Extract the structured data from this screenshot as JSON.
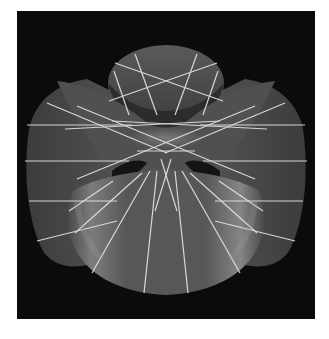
{
  "figure": {
    "colors": {
      "background": "#0b0b0b",
      "surface_dark": "#3a3a3a",
      "surface_mid": "#5e5e5e",
      "surface_light": "#8a8a8a",
      "ruling_lines": "#e6e6e6",
      "page": "#ffffff"
    },
    "caption": ""
  }
}
